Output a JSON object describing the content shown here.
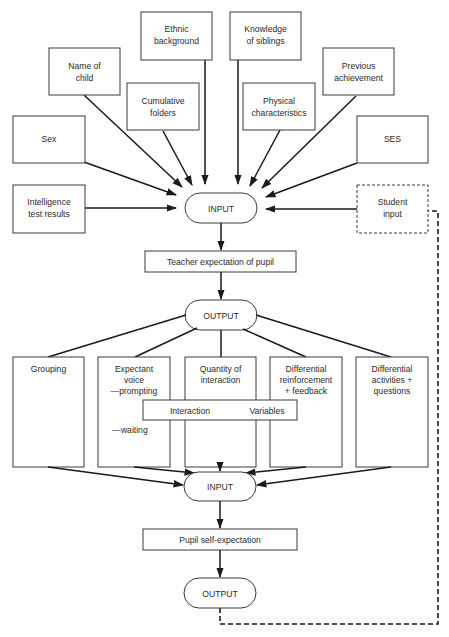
{
  "diagram": {
    "inputs": {
      "ethnic": [
        "Ethnic",
        "background"
      ],
      "siblings": [
        "Knowledge",
        "of siblings"
      ],
      "name": [
        "Name of",
        "child"
      ],
      "previous": [
        "Previous",
        "achievement"
      ],
      "cumulative": [
        "Cumulative",
        "folders"
      ],
      "physical": [
        "Physical",
        "characteristics"
      ],
      "sex": [
        "Sex"
      ],
      "ses": [
        "SES"
      ],
      "intelligence": [
        "Intelligence",
        "test results"
      ],
      "student": [
        "Student",
        "input"
      ]
    },
    "nodes": {
      "input_top": "INPUT",
      "teacher_expectation": "Teacher expectation of pupil",
      "output_mid": "OUTPUT",
      "input_bottom": "INPUT",
      "pupil_self_expectation": "Pupil self-expectation",
      "output_bottom": "OUTPUT"
    },
    "variables": {
      "grouping": [
        "Grouping"
      ],
      "expectant": [
        "Expectant",
        "voice",
        "—prompting"
      ],
      "expectant_waiting": "—waiting",
      "quantity": [
        "Quantity of",
        "interaction"
      ],
      "reinforcement": [
        "Differential",
        "reinforcement",
        "+ feedback"
      ],
      "activities": [
        "Differential",
        "activities +",
        "questions"
      ]
    },
    "interaction_band": {
      "left": "Interaction",
      "right": "Variables"
    }
  }
}
